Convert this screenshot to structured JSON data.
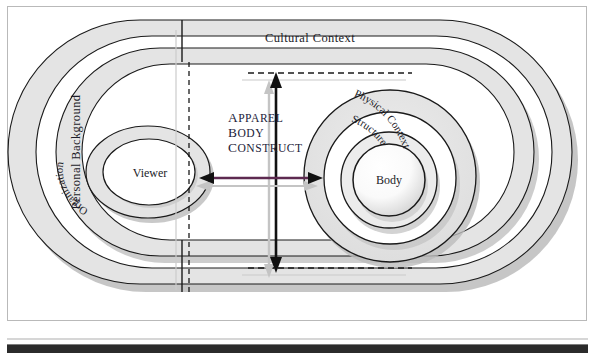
{
  "figure": {
    "title_construct": {
      "line1": "Apparel",
      "line2": "Body",
      "line3": "Construct"
    },
    "labels": {
      "cultural_context": "Cultural Context",
      "personal_background": "Personal Background",
      "physical_context": "Physical Context",
      "structure": "Structure",
      "organization": "Organization",
      "viewer": "Viewer",
      "body": "Body"
    }
  },
  "colors": {
    "band_fill": "#e2e2e2",
    "band_stroke": "#1a1a1a",
    "shadow": "#b5b5b5",
    "arrow_black": "#111111",
    "arrow_shadow": "#bdbdbd",
    "arrow_purple": "#5d2a50",
    "text_dark": "#1c1c28",
    "organization_accent": "#4e8a4e",
    "frame_border": "#b9b9b9",
    "rule_dark": "#2b2b2b"
  },
  "chart_data": {
    "type": "diagram",
    "title": "Apparel Body Construct",
    "nodes": [
      {
        "id": "personal_background",
        "label": "Personal Background",
        "shape": "stadium-band",
        "level": 1,
        "side": "left-outer"
      },
      {
        "id": "cultural_context",
        "label": "Cultural Context",
        "shape": "stadium-band",
        "level": 2,
        "side": "outer"
      },
      {
        "id": "organization",
        "label": "Organization",
        "shape": "ellipse-ring",
        "level": 3,
        "side": "left"
      },
      {
        "id": "viewer",
        "label": "Viewer",
        "shape": "ellipse",
        "level": 4,
        "side": "left"
      },
      {
        "id": "physical_context",
        "label": "Physical Context",
        "shape": "circle-ring",
        "level": 3,
        "side": "right"
      },
      {
        "id": "structure",
        "label": "Structure",
        "shape": "circle-ring",
        "level": 4,
        "side": "right"
      },
      {
        "id": "body",
        "label": "Body",
        "shape": "circle",
        "level": 5,
        "side": "right"
      }
    ],
    "connectors": [
      {
        "id": "viewer-body-link",
        "from": "viewer",
        "to": "body",
        "style": "double-headed",
        "orientation": "horizontal",
        "color": "#5d2a50"
      },
      {
        "id": "apparel-body-construct-axis",
        "label": "Apparel Body Construct",
        "style": "double-headed",
        "orientation": "vertical",
        "color": "#111111"
      },
      {
        "id": "construct-boundary-top",
        "style": "dashed",
        "orientation": "horizontal"
      },
      {
        "id": "construct-boundary-bottom",
        "style": "dashed",
        "orientation": "horizontal"
      },
      {
        "id": "viewer-field-divider",
        "style": "dashed",
        "orientation": "vertical"
      }
    ]
  }
}
